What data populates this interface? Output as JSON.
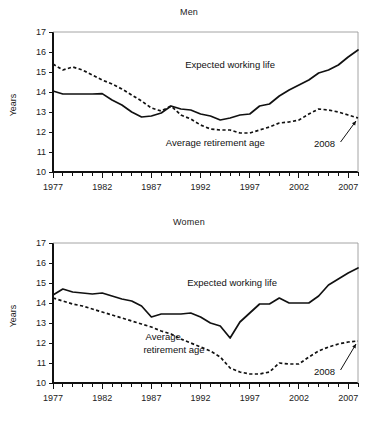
{
  "figure": {
    "y_axis_label": "Years"
  },
  "chart_data": [
    {
      "type": "line",
      "title": "Men",
      "xlabel": "",
      "ylabel": "Years",
      "xlim": [
        1977,
        2008
      ],
      "ylim": [
        10,
        17
      ],
      "ytick_labels": [
        "10",
        "11",
        "12",
        "13",
        "14",
        "15",
        "16",
        "17"
      ],
      "yticks": [
        10,
        11,
        12,
        13,
        14,
        15,
        16,
        17
      ],
      "xtick_labels": [
        "1977",
        "1982",
        "1987",
        "1992",
        "1997",
        "2002",
        "2007"
      ],
      "xticks": [
        1977,
        1982,
        1987,
        1992,
        1997,
        2002,
        2007
      ],
      "minor_xticks_every": 1,
      "grid": false,
      "legend_position": "inline-annotations",
      "annotations": [
        {
          "text": "Expected working life",
          "x": 1995.0,
          "y": 15.2
        },
        {
          "text": "Average retirement age",
          "x": 1993.5,
          "y": 11.3
        },
        {
          "text": "2008",
          "x": 2004.6,
          "y": 11.25
        }
      ],
      "x": [
        1977,
        1978,
        1979,
        1980,
        1981,
        1982,
        1983,
        1984,
        1985,
        1986,
        1987,
        1988,
        1989,
        1990,
        1991,
        1992,
        1993,
        1994,
        1995,
        1996,
        1997,
        1998,
        1999,
        2000,
        2001,
        2002,
        2003,
        2004,
        2005,
        2006,
        2007,
        2008
      ],
      "series": [
        {
          "name": "Expected working life",
          "style": "solid",
          "values": [
            14.05,
            13.9,
            13.9,
            13.9,
            13.9,
            13.92,
            13.6,
            13.35,
            13.0,
            12.75,
            12.8,
            12.95,
            13.3,
            13.15,
            13.1,
            12.9,
            12.8,
            12.6,
            12.7,
            12.85,
            12.9,
            13.3,
            13.4,
            13.8,
            14.1,
            14.35,
            14.6,
            14.95,
            15.1,
            15.35,
            15.75,
            16.1
          ]
        },
        {
          "name": "Average retirement age",
          "style": "dashed",
          "values": [
            15.4,
            15.1,
            15.25,
            15.1,
            14.85,
            14.6,
            14.4,
            14.15,
            13.85,
            13.55,
            13.2,
            13.05,
            13.3,
            12.85,
            12.65,
            12.35,
            12.15,
            12.1,
            12.1,
            11.95,
            11.95,
            12.1,
            12.25,
            12.45,
            12.5,
            12.6,
            12.9,
            13.15,
            13.1,
            13.0,
            12.85,
            12.7
          ]
        }
      ]
    },
    {
      "type": "line",
      "title": "Women",
      "xlabel": "",
      "ylabel": "Years",
      "xlim": [
        1977,
        2008
      ],
      "ylim": [
        10,
        17
      ],
      "ytick_labels": [
        "10",
        "11",
        "12",
        "13",
        "14",
        "15",
        "16",
        "17"
      ],
      "yticks": [
        10,
        11,
        12,
        13,
        14,
        15,
        16,
        17
      ],
      "xtick_labels": [
        "1977",
        "1982",
        "1987",
        "1992",
        "1997",
        "2002",
        "2007"
      ],
      "xticks": [
        1977,
        1982,
        1987,
        1992,
        1997,
        2002,
        2007
      ],
      "minor_xticks_every": 1,
      "grid": false,
      "legend_position": "inline-annotations",
      "annotations": [
        {
          "text": "Expected working life",
          "x": 1995.2,
          "y": 14.85
        },
        {
          "text": "Average",
          "x": 1988.2,
          "y": 12.15
        },
        {
          "text": "retirement age",
          "x": 1989.3,
          "y": 11.5
        },
        {
          "text": "2008",
          "x": 2004.6,
          "y": 10.4
        }
      ],
      "x": [
        1977,
        1978,
        1979,
        1980,
        1981,
        1982,
        1983,
        1984,
        1985,
        1986,
        1987,
        1988,
        1989,
        1990,
        1991,
        1992,
        1993,
        1994,
        1995,
        1996,
        1997,
        1998,
        1999,
        2000,
        2001,
        2002,
        2003,
        2004,
        2005,
        2006,
        2007,
        2008
      ],
      "series": [
        {
          "name": "Expected working life",
          "style": "solid",
          "values": [
            14.4,
            14.7,
            14.55,
            14.5,
            14.45,
            14.5,
            14.35,
            14.2,
            14.1,
            13.85,
            13.3,
            13.45,
            13.45,
            13.45,
            13.5,
            13.3,
            13.0,
            12.85,
            12.25,
            13.05,
            13.5,
            13.95,
            13.95,
            14.25,
            14.0,
            14.0,
            14.0,
            14.35,
            14.9,
            15.2,
            15.5,
            15.75
          ]
        },
        {
          "name": "Average retirement age",
          "style": "dashed",
          "values": [
            14.25,
            14.1,
            13.95,
            13.85,
            13.7,
            13.55,
            13.4,
            13.25,
            13.1,
            12.95,
            12.8,
            12.6,
            12.45,
            12.2,
            12.0,
            11.8,
            11.6,
            11.3,
            10.75,
            10.55,
            10.45,
            10.45,
            10.55,
            11.0,
            10.95,
            10.95,
            11.3,
            11.6,
            11.8,
            11.95,
            12.05,
            12.1
          ]
        }
      ]
    }
  ]
}
